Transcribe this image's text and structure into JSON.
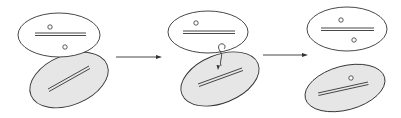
{
  "diagram": {
    "type": "process",
    "colors": {
      "donor_fill": "#ffffff",
      "recipient_fill": "#e6e6e6",
      "stroke": "#333333"
    },
    "stages": [
      {
        "id": "stage-1",
        "cells": [
          {
            "role": "donor",
            "fill": "white",
            "plasmids": 2,
            "chromosome": "double-line"
          },
          {
            "role": "recipient",
            "fill": "gray",
            "plasmids": 0,
            "chromosome": "double-line"
          }
        ]
      },
      {
        "id": "stage-2",
        "cells": [
          {
            "role": "donor",
            "fill": "white",
            "plasmids": 1,
            "chromosome": "double-line"
          },
          {
            "role": "recipient",
            "fill": "gray",
            "plasmids": 0,
            "chromosome": "double-line"
          }
        ],
        "connection": "pilus-bridge"
      },
      {
        "id": "stage-3",
        "cells": [
          {
            "role": "donor",
            "fill": "white",
            "plasmids": 2,
            "chromosome": "double-line"
          },
          {
            "role": "recipient",
            "fill": "gray",
            "plasmids": 1,
            "chromosome": "double-line"
          }
        ]
      }
    ],
    "arrows": [
      {
        "from": "stage-1",
        "to": "stage-2"
      },
      {
        "from": "stage-2",
        "to": "stage-3"
      }
    ]
  }
}
